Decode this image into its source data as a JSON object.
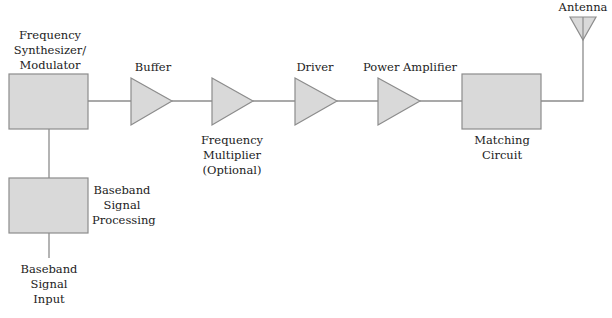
{
  "diagram": {
    "colors": {
      "fill": "#d9d9d9",
      "stroke": "#8c8c8c",
      "line": "#8c8c8c",
      "text": "#222222"
    },
    "blocks": {
      "synth": {
        "lines": [
          "Frequency",
          "Synthesizer/",
          "Modulator"
        ]
      },
      "buffer": {
        "label": "Buffer"
      },
      "multiplier": {
        "lines": [
          "Frequency",
          "Multiplier",
          "(Optional)"
        ]
      },
      "driver": {
        "label": "Driver"
      },
      "pa": {
        "label": "Power Amplifier"
      },
      "matching": {
        "lines": [
          "Matching",
          "Circuit"
        ]
      },
      "antenna": {
        "label": "Antenna"
      },
      "baseband": {
        "lines": [
          "Baseband",
          "Signal",
          "Processing"
        ]
      },
      "bb_input": {
        "lines": [
          "Baseband",
          "Signal",
          "Input"
        ]
      }
    }
  }
}
